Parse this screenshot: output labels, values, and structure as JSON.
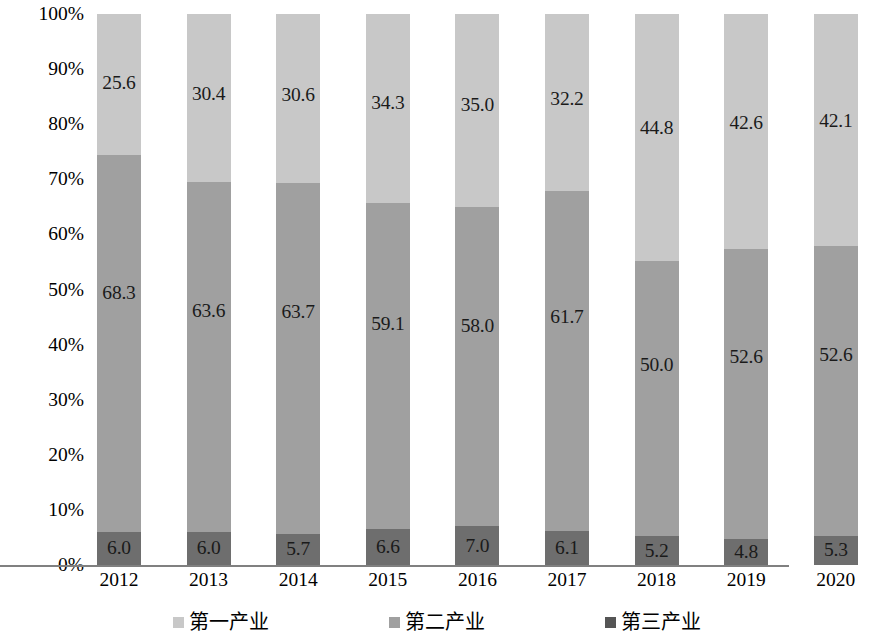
{
  "chart_data": {
    "type": "bar",
    "stacked": true,
    "normalized_percent": true,
    "title": "",
    "subtitle": "",
    "xlabel": "",
    "ylabel": "",
    "ylim": [
      0,
      100
    ],
    "grid": false,
    "legend_position": "bottom",
    "categories": [
      "2012",
      "2013",
      "2014",
      "2015",
      "2016",
      "2017",
      "2018",
      "2019",
      "2020"
    ],
    "ytick_labels": [
      "0%",
      "10%",
      "20%",
      "30%",
      "40%",
      "50%",
      "60%",
      "70%",
      "80%",
      "90%",
      "100%"
    ],
    "ytick_values": [
      0,
      10,
      20,
      30,
      40,
      50,
      60,
      70,
      80,
      90,
      100
    ],
    "series": [
      {
        "name": "第一产业",
        "color": "#c8c8c8",
        "stack_position": "top",
        "values": [
          25.6,
          30.4,
          30.6,
          34.3,
          35.0,
          32.2,
          44.8,
          42.6,
          42.1
        ],
        "labels": [
          "25.6",
          "30.4",
          "30.6",
          "34.3",
          "35.0",
          "32.2",
          "44.8",
          "42.6",
          "42.1"
        ]
      },
      {
        "name": "第二产业",
        "color": "#a0a0a0",
        "stack_position": "middle",
        "values": [
          68.3,
          63.6,
          63.7,
          59.1,
          58.0,
          61.7,
          50.0,
          52.6,
          52.6
        ],
        "labels": [
          "68.3",
          "63.6",
          "63.7",
          "59.1",
          "58.0",
          "61.7",
          "50.0",
          "52.6",
          "52.6"
        ]
      },
      {
        "name": "第三产业",
        "color": "#6e6e6e",
        "stack_position": "bottom",
        "values": [
          6.0,
          6.0,
          5.7,
          6.6,
          7.0,
          6.1,
          5.2,
          4.8,
          5.3
        ],
        "labels": [
          "6.0",
          "6.0",
          "5.7",
          "6.6",
          "7.0",
          "6.1",
          "5.2",
          "4.8",
          "5.3"
        ]
      }
    ]
  },
  "legend": {
    "items": [
      {
        "label": "第一产业",
        "color": "#c8c8c8"
      },
      {
        "label": "第二产业",
        "color": "#a0a0a0"
      },
      {
        "label": "第三产业",
        "color": "#555555"
      }
    ]
  }
}
